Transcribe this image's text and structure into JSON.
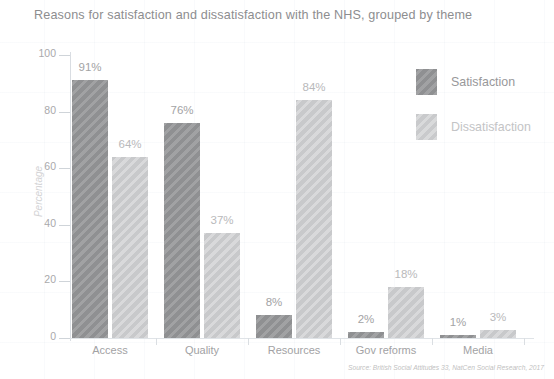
{
  "chart_data": {
    "type": "bar",
    "title": "Reasons for satisfaction and dissatisfaction with the NHS, grouped by theme",
    "xlabel": "",
    "ylabel": "Percentage",
    "ylim": [
      0,
      100
    ],
    "yticks": [
      0,
      20,
      40,
      60,
      80,
      100
    ],
    "grid": true,
    "legend_position": "top-right",
    "categories": [
      "Access",
      "Quality",
      "Resources",
      "Gov reforms",
      "Media"
    ],
    "series": [
      {
        "name": "Satisfaction",
        "color": "#8f9092",
        "values": [
          91,
          76,
          8,
          2,
          1
        ],
        "labels": [
          "91%",
          "76%",
          "8%",
          "2%",
          "1%"
        ]
      },
      {
        "name": "Dissatisfaction",
        "color": "#c8c9cb",
        "values": [
          64,
          37,
          84,
          18,
          3
        ],
        "labels": [
          "64%",
          "37%",
          "84%",
          "18%",
          "3%"
        ]
      }
    ],
    "source": "Source: British Social Attitudes 33, NatCen Social Research, 2017"
  },
  "legend": {
    "items": [
      {
        "label": "Satisfaction"
      },
      {
        "label": "Dissatisfaction"
      }
    ]
  },
  "axis": {
    "tick_0": "0",
    "tick_20": "20",
    "tick_40": "40",
    "tick_60": "60",
    "tick_80": "80",
    "tick_100": "100",
    "y_title": "Percentage"
  }
}
